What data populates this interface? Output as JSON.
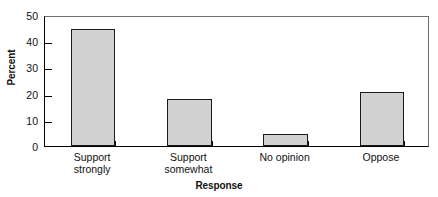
{
  "chart_data": {
    "type": "bar",
    "title": "",
    "subtitle": "",
    "xlabel": "Response",
    "ylabel": "Percent",
    "categories": [
      "Support strongly",
      "Support somewhat",
      "No opinion",
      "Oppose"
    ],
    "category_lines": [
      [
        "Support",
        "strongly"
      ],
      [
        "Support",
        "somewhat"
      ],
      [
        "No opinion"
      ],
      [
        "Oppose"
      ]
    ],
    "values": [
      44.5,
      18,
      4.5,
      20.5
    ],
    "ylim": [
      0,
      50
    ],
    "ytick_values": [
      0,
      10,
      20,
      30,
      40,
      50
    ],
    "ytick_labels": [
      "0",
      "10",
      "20",
      "30",
      "40",
      "50"
    ],
    "grid": false,
    "legend": null,
    "bar_fill_color": "#d2d2d2",
    "bar_edge_color": "#1a1a1a",
    "axis_color": "#000000",
    "background_color": "#ffffff"
  }
}
